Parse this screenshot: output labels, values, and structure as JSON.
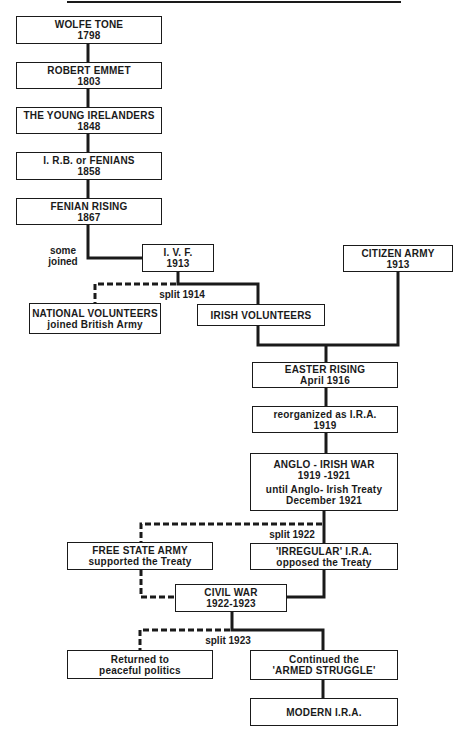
{
  "diagram": {
    "type": "flowchart",
    "nodes": [
      {
        "id": "wolfe_tone",
        "line1": "WOLFE TONE",
        "line2": "1798"
      },
      {
        "id": "robert_emmet",
        "line1": "ROBERT EMMET",
        "line2": "1803"
      },
      {
        "id": "young_irelanders",
        "line1": "THE YOUNG IRELANDERS",
        "line2": "1848"
      },
      {
        "id": "irb_fenians",
        "line1": "I. R.B. or FENIANS",
        "line2": "1858"
      },
      {
        "id": "fenian_rising",
        "line1": "FENIAN RISING",
        "line2": "1867"
      },
      {
        "id": "ivf",
        "line1": "I. V. F.",
        "line2": "1913"
      },
      {
        "id": "citizen_army",
        "line1": "CITIZEN ARMY",
        "line2": "1913"
      },
      {
        "id": "national_volunteers",
        "line1": "NATIONAL VOLUNTEERS",
        "line2": "joined British Army"
      },
      {
        "id": "irish_volunteers",
        "line1": "IRISH VOLUNTEERS",
        "line2": ""
      },
      {
        "id": "easter_rising",
        "line1": "EASTER RISING",
        "line2": "April 1916"
      },
      {
        "id": "reorganized_ira",
        "line1": "reorganized as I.R.A.",
        "line2": "1919"
      },
      {
        "id": "anglo_irish_war",
        "line1": "ANGLO - IRISH WAR",
        "line2": "1919 -1921",
        "line3": "until Anglo- Irish Treaty",
        "line4": "December 1921"
      },
      {
        "id": "free_state_army",
        "line1": "FREE STATE ARMY",
        "line2": "supported the Treaty"
      },
      {
        "id": "irregular_ira",
        "line1": "'IRREGULAR' I.R.A.",
        "line2": "opposed the Treaty"
      },
      {
        "id": "civil_war",
        "line1": "CIVIL WAR",
        "line2": "1922-1923"
      },
      {
        "id": "returned_politics",
        "line1": "Returned to",
        "line2": "peaceful politics"
      },
      {
        "id": "armed_struggle",
        "line1": "Continued the",
        "line2": "'ARMED STRUGGLE'"
      },
      {
        "id": "modern_ira",
        "line1": "MODERN I.R.A.",
        "line2": ""
      }
    ],
    "labels": {
      "some_joined": "some joined",
      "split_1914": "split 1914",
      "split_1922": "split 1922",
      "split_1923": "split 1923"
    },
    "edges": [
      {
        "from": "wolfe_tone",
        "to": "robert_emmet",
        "style": "solid"
      },
      {
        "from": "robert_emmet",
        "to": "young_irelanders",
        "style": "solid"
      },
      {
        "from": "young_irelanders",
        "to": "irb_fenians",
        "style": "solid"
      },
      {
        "from": "irb_fenians",
        "to": "fenian_rising",
        "style": "solid"
      },
      {
        "from": "fenian_rising",
        "to": "ivf",
        "style": "solid",
        "label": "some joined"
      },
      {
        "from": "ivf",
        "to": "national_volunteers",
        "style": "dashed",
        "label": "split 1914"
      },
      {
        "from": "ivf",
        "to": "irish_volunteers",
        "style": "solid"
      },
      {
        "from": "irish_volunteers",
        "to": "easter_rising",
        "style": "solid"
      },
      {
        "from": "citizen_army",
        "to": "easter_rising",
        "style": "solid"
      },
      {
        "from": "easter_rising",
        "to": "reorganized_ira",
        "style": "solid"
      },
      {
        "from": "reorganized_ira",
        "to": "anglo_irish_war",
        "style": "solid"
      },
      {
        "from": "anglo_irish_war",
        "to": "free_state_army",
        "style": "dashed",
        "label": "split 1922"
      },
      {
        "from": "anglo_irish_war",
        "to": "irregular_ira",
        "style": "solid"
      },
      {
        "from": "free_state_army",
        "to": "civil_war",
        "style": "dashed"
      },
      {
        "from": "irregular_ira",
        "to": "civil_war",
        "style": "solid"
      },
      {
        "from": "civil_war",
        "to": "returned_politics",
        "style": "dashed",
        "label": "split 1923"
      },
      {
        "from": "civil_war",
        "to": "armed_struggle",
        "style": "solid"
      },
      {
        "from": "armed_struggle",
        "to": "modern_ira",
        "style": "solid"
      }
    ],
    "colors": {
      "ink": "#1a1a1a",
      "paper": "#ffffff"
    }
  }
}
